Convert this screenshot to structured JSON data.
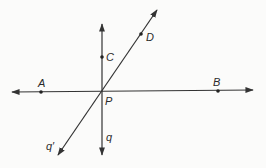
{
  "diagram": {
    "type": "geometry-lines",
    "colors": {
      "line": "#333333",
      "point": "#222222",
      "label": "#2a2a2a",
      "background": "#fbfbfa"
    },
    "points": [
      {
        "name": "A",
        "label": "A",
        "x": 41,
        "y": 92,
        "label_x": 38,
        "label_y": 87
      },
      {
        "name": "B",
        "label": "B",
        "x": 218,
        "y": 91,
        "label_x": 213,
        "label_y": 86
      },
      {
        "name": "C",
        "label": "C",
        "x": 102,
        "y": 57,
        "label_x": 106,
        "label_y": 61
      },
      {
        "name": "D",
        "label": "D",
        "x": 141,
        "y": 34,
        "label_x": 146,
        "label_y": 41
      },
      {
        "name": "P",
        "label": "P",
        "x": 102,
        "y": 91,
        "label_x": 105,
        "label_y": 105
      }
    ],
    "lines": [
      {
        "name": "line-AB",
        "x1": 12,
        "y1": 92,
        "x2": 253,
        "y2": 90,
        "arrows": "both"
      },
      {
        "name": "line-q",
        "label": "q",
        "x1": 102,
        "y1": 24,
        "x2": 102,
        "y2": 155,
        "arrows": "both",
        "label_x": 106,
        "label_y": 141
      },
      {
        "name": "line-q-prime",
        "label": "q′",
        "x1": 157,
        "y1": 10,
        "x2": 58,
        "y2": 155,
        "arrows": "both",
        "label_x": 46,
        "label_y": 150
      }
    ]
  }
}
